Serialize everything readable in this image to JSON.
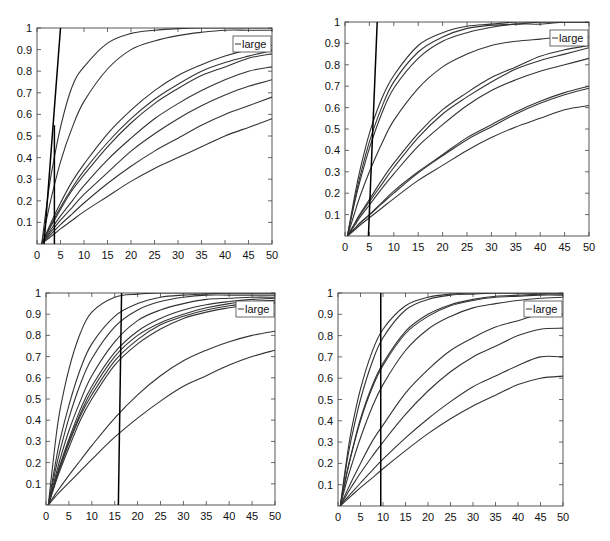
{
  "chart_data": [
    {
      "type": "line",
      "panel": "top-left",
      "title": "",
      "xlabel": "",
      "ylabel": "",
      "xlim": [
        0,
        50
      ],
      "ylim": [
        0,
        1
      ],
      "xticks": [
        "0",
        "5",
        "10",
        "15",
        "20",
        "25",
        "30",
        "35",
        "40",
        "45",
        "50"
      ],
      "yticks": [
        "0.1",
        "0.2",
        "0.3",
        "0.4",
        "0.5",
        "0.6",
        "0.7",
        "0.8",
        "0.9",
        "1"
      ],
      "legend": {
        "entries": [
          "large"
        ],
        "placement": "top-right"
      },
      "x": [
        1,
        2,
        3,
        5,
        7.5,
        10,
        15,
        20,
        25,
        30,
        35,
        40,
        45,
        50
      ],
      "series": [
        {
          "name": "curve-1",
          "values": [
            0,
            0.17,
            0.32,
            0.54,
            0.73,
            0.82,
            0.93,
            0.975,
            0.99,
            0.997,
            1.0,
            1.0,
            1.0,
            1.0
          ]
        },
        {
          "name": "curve-2",
          "values": [
            0,
            0.11,
            0.21,
            0.38,
            0.54,
            0.66,
            0.81,
            0.9,
            0.94,
            0.965,
            0.98,
            0.99,
            0.99,
            0.99
          ]
        },
        {
          "name": "curve-3",
          "values": [
            0,
            0.05,
            0.1,
            0.19,
            0.29,
            0.37,
            0.51,
            0.62,
            0.71,
            0.78,
            0.83,
            0.87,
            0.9,
            0.92
          ]
        },
        {
          "name": "curve-4",
          "values": [
            0,
            0.045,
            0.09,
            0.17,
            0.26,
            0.34,
            0.47,
            0.58,
            0.67,
            0.74,
            0.8,
            0.84,
            0.87,
            0.895
          ]
        },
        {
          "name": "curve-5",
          "values": [
            0,
            0.042,
            0.083,
            0.16,
            0.25,
            0.32,
            0.45,
            0.56,
            0.65,
            0.72,
            0.78,
            0.82,
            0.86,
            0.88
          ]
        },
        {
          "name": "curve-6",
          "values": [
            0,
            0.034,
            0.068,
            0.13,
            0.2,
            0.27,
            0.39,
            0.49,
            0.58,
            0.65,
            0.71,
            0.76,
            0.8,
            0.82
          ]
        },
        {
          "name": "curve-7",
          "values": [
            0,
            0.029,
            0.057,
            0.11,
            0.17,
            0.23,
            0.33,
            0.43,
            0.51,
            0.58,
            0.64,
            0.69,
            0.73,
            0.76
          ]
        },
        {
          "name": "curve-8",
          "values": [
            0,
            0.023,
            0.046,
            0.09,
            0.14,
            0.19,
            0.28,
            0.36,
            0.43,
            0.49,
            0.55,
            0.6,
            0.64,
            0.68
          ]
        },
        {
          "name": "curve-9",
          "values": [
            0,
            0.018,
            0.035,
            0.07,
            0.11,
            0.15,
            0.22,
            0.29,
            0.35,
            0.4,
            0.45,
            0.5,
            0.54,
            0.58
          ]
        }
      ],
      "reference_lines": [
        {
          "name": "steep-line",
          "points": [
            [
              1.5,
              0
            ],
            [
              5,
              1
            ]
          ]
        },
        {
          "name": "threshold-line",
          "points": [
            [
              3.7,
              0
            ],
            [
              3.7,
              0.55
            ]
          ]
        }
      ]
    },
    {
      "type": "line",
      "panel": "top-right",
      "title": "",
      "xlabel": "",
      "ylabel": "",
      "xlim": [
        0,
        50
      ],
      "ylim": [
        0,
        1
      ],
      "xticks": [
        "0",
        "5",
        "10",
        "15",
        "20",
        "25",
        "30",
        "35",
        "40",
        "45",
        "50"
      ],
      "yticks": [
        "0.1",
        "0.2",
        "0.3",
        "0.4",
        "0.5",
        "0.6",
        "0.7",
        "0.8",
        "0.9",
        "1"
      ],
      "legend": {
        "entries": [
          "large"
        ],
        "placement": "top-right"
      },
      "x": [
        0.5,
        2,
        3,
        5,
        7.5,
        10,
        15,
        20,
        25,
        30,
        35,
        40,
        45,
        50
      ],
      "series": [
        {
          "name": "curve-1",
          "values": [
            0,
            0.19,
            0.3,
            0.48,
            0.64,
            0.75,
            0.89,
            0.95,
            0.98,
            0.99,
            1.0,
            1.0,
            1.0,
            1.0
          ]
        },
        {
          "name": "curve-2",
          "values": [
            0,
            0.17,
            0.27,
            0.44,
            0.6,
            0.72,
            0.86,
            0.93,
            0.97,
            0.985,
            0.99,
            1.0,
            1.0,
            1.0
          ]
        },
        {
          "name": "curve-3",
          "values": [
            0,
            0.16,
            0.25,
            0.41,
            0.57,
            0.69,
            0.83,
            0.91,
            0.95,
            0.975,
            0.99,
            0.99,
            1.0,
            1.0
          ]
        },
        {
          "name": "curve-4",
          "values": [
            0,
            0.11,
            0.18,
            0.3,
            0.43,
            0.54,
            0.69,
            0.79,
            0.85,
            0.89,
            0.91,
            0.92,
            0.93,
            0.93
          ]
        },
        {
          "name": "curve-5",
          "values": [
            0,
            0.06,
            0.1,
            0.17,
            0.26,
            0.34,
            0.48,
            0.59,
            0.67,
            0.74,
            0.79,
            0.84,
            0.87,
            0.89
          ]
        },
        {
          "name": "curve-6",
          "values": [
            0,
            0.057,
            0.095,
            0.16,
            0.24,
            0.32,
            0.46,
            0.57,
            0.65,
            0.72,
            0.78,
            0.82,
            0.85,
            0.88
          ]
        },
        {
          "name": "curve-7",
          "values": [
            0,
            0.05,
            0.085,
            0.145,
            0.22,
            0.29,
            0.42,
            0.52,
            0.61,
            0.68,
            0.73,
            0.77,
            0.8,
            0.83
          ]
        },
        {
          "name": "curve-8",
          "values": [
            0,
            0.035,
            0.06,
            0.1,
            0.155,
            0.21,
            0.3,
            0.38,
            0.46,
            0.52,
            0.58,
            0.63,
            0.67,
            0.7
          ]
        },
        {
          "name": "curve-9",
          "values": [
            0,
            0.034,
            0.058,
            0.098,
            0.15,
            0.2,
            0.295,
            0.375,
            0.45,
            0.51,
            0.57,
            0.62,
            0.66,
            0.69
          ]
        },
        {
          "name": "curve-10",
          "values": [
            0,
            0.029,
            0.049,
            0.085,
            0.13,
            0.175,
            0.26,
            0.33,
            0.4,
            0.46,
            0.51,
            0.55,
            0.59,
            0.61
          ]
        }
      ],
      "reference_lines": [
        {
          "name": "steep-line",
          "points": [
            [
              4.8,
              0
            ],
            [
              6.6,
              1
            ]
          ]
        }
      ]
    },
    {
      "type": "line",
      "panel": "bottom-left",
      "title": "",
      "xlabel": "",
      "ylabel": "",
      "xlim": [
        0,
        50
      ],
      "ylim": [
        0,
        1
      ],
      "xticks": [
        "0",
        "5",
        "10",
        "15",
        "20",
        "25",
        "30",
        "35",
        "40",
        "45",
        "50"
      ],
      "yticks": [
        "0.1",
        "0.2",
        "0.3",
        "0.4",
        "0.5",
        "0.6",
        "0.7",
        "0.8",
        "0.9",
        "1"
      ],
      "legend": {
        "entries": [
          "large"
        ],
        "placement": "top-right"
      },
      "x": [
        0.5,
        2,
        3,
        5,
        7.5,
        10,
        15,
        20,
        25,
        30,
        35,
        40,
        45,
        50
      ],
      "series": [
        {
          "name": "curve-1",
          "values": [
            0,
            0.29,
            0.44,
            0.64,
            0.81,
            0.91,
            0.98,
            0.995,
            1.0,
            1.0,
            1.0,
            1.0,
            1.0,
            1.0
          ]
        },
        {
          "name": "curve-2",
          "values": [
            0,
            0.19,
            0.3,
            0.47,
            0.64,
            0.76,
            0.89,
            0.95,
            0.98,
            0.99,
            0.995,
            1.0,
            1.0,
            1.0
          ]
        },
        {
          "name": "curve-3",
          "values": [
            0,
            0.16,
            0.25,
            0.41,
            0.57,
            0.69,
            0.84,
            0.92,
            0.96,
            0.98,
            0.99,
            0.99,
            0.99,
            0.99
          ]
        },
        {
          "name": "curve-4",
          "values": [
            0,
            0.13,
            0.21,
            0.35,
            0.49,
            0.61,
            0.77,
            0.87,
            0.92,
            0.95,
            0.97,
            0.975,
            0.98,
            0.98
          ]
        },
        {
          "name": "curve-5",
          "values": [
            0,
            0.115,
            0.185,
            0.31,
            0.45,
            0.56,
            0.72,
            0.82,
            0.88,
            0.92,
            0.945,
            0.96,
            0.97,
            0.975
          ]
        },
        {
          "name": "curve-6",
          "values": [
            0,
            0.11,
            0.18,
            0.3,
            0.43,
            0.54,
            0.7,
            0.8,
            0.86,
            0.9,
            0.93,
            0.95,
            0.96,
            0.965
          ]
        },
        {
          "name": "curve-7",
          "values": [
            0,
            0.105,
            0.17,
            0.29,
            0.42,
            0.52,
            0.68,
            0.78,
            0.85,
            0.89,
            0.92,
            0.94,
            0.95,
            0.955
          ]
        },
        {
          "name": "curve-8",
          "values": [
            0,
            0.1,
            0.16,
            0.27,
            0.4,
            0.5,
            0.66,
            0.76,
            0.83,
            0.88,
            0.91,
            0.93,
            0.945,
            0.95
          ]
        },
        {
          "name": "curve-9",
          "values": [
            0,
            0.05,
            0.08,
            0.14,
            0.21,
            0.28,
            0.41,
            0.52,
            0.61,
            0.68,
            0.73,
            0.77,
            0.8,
            0.82
          ]
        },
        {
          "name": "curve-10",
          "values": [
            0,
            0.038,
            0.062,
            0.105,
            0.16,
            0.215,
            0.32,
            0.41,
            0.49,
            0.56,
            0.61,
            0.66,
            0.7,
            0.73
          ]
        }
      ],
      "reference_lines": [
        {
          "name": "threshold-line",
          "points": [
            [
              15.8,
              0
            ],
            [
              16.5,
              1
            ]
          ]
        }
      ]
    },
    {
      "type": "line",
      "panel": "bottom-right",
      "title": "",
      "xlabel": "",
      "ylabel": "",
      "xlim": [
        0,
        50
      ],
      "ylim": [
        0,
        1
      ],
      "xticks": [
        "0",
        "5",
        "10",
        "15",
        "20",
        "25",
        "30",
        "35",
        "40",
        "45",
        "50"
      ],
      "yticks": [
        "0.1",
        "0.2",
        "0.3",
        "0.4",
        "0.5",
        "0.6",
        "0.7",
        "0.8",
        "0.9",
        "1"
      ],
      "legend": {
        "entries": [
          "large"
        ],
        "placement": "top-right"
      },
      "x": [
        0.5,
        2,
        3,
        5,
        7.5,
        10,
        15,
        20,
        25,
        30,
        35,
        40,
        45,
        50
      ],
      "series": [
        {
          "name": "curve-1",
          "values": [
            0,
            0.23,
            0.36,
            0.55,
            0.72,
            0.83,
            0.94,
            0.98,
            0.995,
            1.0,
            1.0,
            1.0,
            1.0,
            1.0
          ]
        },
        {
          "name": "curve-2",
          "values": [
            0,
            0.21,
            0.32,
            0.5,
            0.67,
            0.79,
            0.92,
            0.97,
            0.99,
            0.995,
            1.0,
            1.0,
            1.0,
            1.0
          ]
        },
        {
          "name": "curve-3",
          "values": [
            0,
            0.16,
            0.25,
            0.41,
            0.56,
            0.67,
            0.82,
            0.9,
            0.945,
            0.97,
            0.985,
            0.99,
            0.995,
            0.995
          ]
        },
        {
          "name": "curve-4",
          "values": [
            0,
            0.155,
            0.245,
            0.4,
            0.55,
            0.66,
            0.81,
            0.89,
            0.94,
            0.965,
            0.98,
            0.985,
            0.99,
            0.99
          ]
        },
        {
          "name": "curve-5",
          "values": [
            0,
            0.12,
            0.19,
            0.32,
            0.46,
            0.57,
            0.73,
            0.83,
            0.89,
            0.93,
            0.95,
            0.965,
            0.975,
            0.98
          ]
        },
        {
          "name": "curve-6",
          "values": [
            0,
            0.07,
            0.115,
            0.2,
            0.3,
            0.38,
            0.53,
            0.64,
            0.73,
            0.79,
            0.84,
            0.87,
            0.9,
            0.9
          ]
        },
        {
          "name": "curve-7",
          "values": [
            0,
            0.055,
            0.09,
            0.155,
            0.23,
            0.3,
            0.43,
            0.54,
            0.63,
            0.7,
            0.75,
            0.8,
            0.83,
            0.835
          ]
        },
        {
          "name": "curve-8",
          "values": [
            0,
            0.038,
            0.062,
            0.108,
            0.165,
            0.22,
            0.32,
            0.41,
            0.49,
            0.56,
            0.61,
            0.66,
            0.7,
            0.7
          ]
        },
        {
          "name": "curve-9",
          "values": [
            0,
            0.03,
            0.049,
            0.086,
            0.13,
            0.175,
            0.26,
            0.34,
            0.41,
            0.47,
            0.52,
            0.57,
            0.6,
            0.61
          ]
        }
      ],
      "reference_lines": [
        {
          "name": "threshold-line",
          "points": [
            [
              9.5,
              0
            ],
            [
              9.5,
              1
            ]
          ]
        }
      ]
    }
  ]
}
